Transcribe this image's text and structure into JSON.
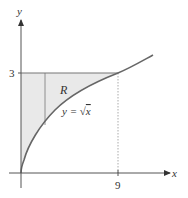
{
  "diagram": {
    "axes": {
      "x_label": "x",
      "y_label": "y",
      "x_tick": "9",
      "y_tick": "3"
    },
    "region_label": "R",
    "curve_label": "y = √x",
    "curve_label_parts": {
      "lhs": "y = ",
      "radical": "√",
      "arg": "x"
    },
    "colors": {
      "axis": "#555555",
      "curve": "#666666",
      "region_fill": "#e9e9e9",
      "dotted": "#aaaaaa"
    }
  }
}
